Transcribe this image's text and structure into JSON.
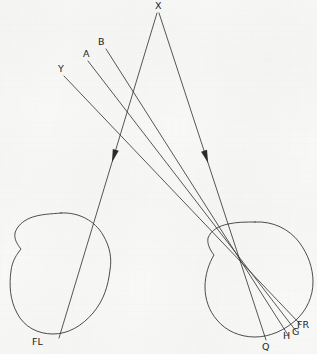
{
  "figure": {
    "background_color": "#f8f8f6",
    "line_color": "#3a3a3a",
    "label_color": "#1d1d1d",
    "width": 317,
    "height": 354
  },
  "labels": {
    "x": "X",
    "b": "B",
    "a": "A",
    "y": "Y",
    "fl": "FL",
    "q": "Q",
    "h": "H",
    "g": "G",
    "fr": "FR"
  },
  "label_positions": {
    "x": {
      "x": 155,
      "y": 9
    },
    "b": {
      "x": 98,
      "y": 45
    },
    "a": {
      "x": 83,
      "y": 57
    },
    "y": {
      "x": 58,
      "y": 72
    },
    "fl": {
      "x": 32,
      "y": 345
    },
    "q": {
      "x": 262,
      "y": 350
    },
    "h": {
      "x": 283,
      "y": 339
    },
    "g": {
      "x": 292,
      "y": 335
    },
    "fr": {
      "x": 297,
      "y": 328
    }
  },
  "geometry": {
    "left_eye": {
      "name": "left-eye",
      "path": "M 61 213 C 79 212 95 221 103 235 C 110 247 112 258 110 270 C 108 286 104 300 93 313 C 82 326 68 334 53 334 C 38 334 24 327 17 313 C 10 300 9 285 11 271 C 12 261 17 254 21 249 C 17 244 14 239 15 233 C 17 226 23 221 30 218 C 40 214 51 214 61 213 Z"
    },
    "right_eye": {
      "name": "right-eye",
      "path": "M 255 222 C 273 221 289 229 299 242 C 308 254 313 268 313 282 C 313 296 307 310 296 320 C 285 330 270 337 255 337 C 240 337 226 331 217 320 C 209 311 205 299 205 287 C 205 275 209 263 214 255 C 210 250 207 244 208 238 C 211 230 219 226 228 224 C 237 222 246 222 255 222 Z"
    },
    "nodal_point": {
      "x": 245,
      "y": 265
    },
    "rays": [
      {
        "name": "ray-x-left",
        "from": "X",
        "x1": 157,
        "y1": 13,
        "x2": 59,
        "y2": 338,
        "arrow_at": 0.44
      },
      {
        "name": "ray-x-right",
        "from": "X",
        "x1": 159,
        "y1": 13,
        "x2": 266,
        "y2": 340,
        "arrow_at": 0.44
      },
      {
        "name": "ray-y",
        "from": "Y",
        "x1": 64,
        "y1": 76,
        "x2": 300,
        "y2": 324
      },
      {
        "name": "ray-a",
        "from": "A",
        "x1": 88,
        "y1": 61,
        "x2": 296,
        "y2": 331
      },
      {
        "name": "ray-b",
        "from": "B",
        "x1": 106,
        "y1": 49,
        "x2": 288,
        "y2": 335
      }
    ]
  }
}
